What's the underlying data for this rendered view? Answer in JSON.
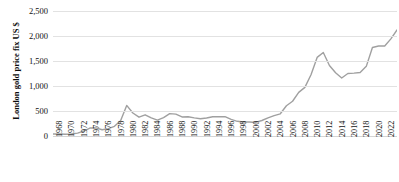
{
  "chart_data": {
    "type": "line",
    "title": "",
    "xlabel": "",
    "ylabel": "London gold price fix US $",
    "ylim": [
      0,
      2500
    ],
    "ytick_labels": [
      "2,500",
      "2,000",
      "1,500",
      "1,000",
      "500",
      "0"
    ],
    "ytick_values": [
      2500,
      2000,
      1500,
      1000,
      500,
      0
    ],
    "grid": true,
    "legend": "none",
    "line_color": "#a0a0a0",
    "gridline_color": "#e2e2e2",
    "x_tick_labels": [
      "1968",
      "1970",
      "1972",
      "1974",
      "1976",
      "1978",
      "1980",
      "1982",
      "1984",
      "1986",
      "1988",
      "1990",
      "1992",
      "1994",
      "1996",
      "1998",
      "2000",
      "2002",
      "2004",
      "2006",
      "2008",
      "2010",
      "2012",
      "2014",
      "2016",
      "2018",
      "2020",
      "2022",
      "2024"
    ],
    "xlim": [
      1968,
      2024
    ],
    "x": [
      1968,
      1969,
      1970,
      1971,
      1972,
      1973,
      1974,
      1975,
      1976,
      1977,
      1978,
      1979,
      1980,
      1981,
      1982,
      1983,
      1984,
      1985,
      1986,
      1987,
      1988,
      1989,
      1990,
      1991,
      1992,
      1993,
      1994,
      1995,
      1996,
      1997,
      1998,
      1999,
      2000,
      2001,
      2002,
      2003,
      2004,
      2005,
      2006,
      2007,
      2008,
      2009,
      2010,
      2011,
      2012,
      2013,
      2014,
      2015,
      2016,
      2017,
      2018,
      2019,
      2020,
      2021,
      2022,
      2023,
      2024
    ],
    "values": [
      39,
      41,
      36,
      41,
      58,
      97,
      159,
      161,
      125,
      148,
      193,
      306,
      612,
      460,
      376,
      424,
      361,
      317,
      368,
      447,
      437,
      381,
      384,
      362,
      344,
      360,
      384,
      384,
      388,
      331,
      294,
      279,
      279,
      271,
      310,
      363,
      409,
      444,
      604,
      695,
      872,
      972,
      1225,
      1572,
      1669,
      1411,
      1266,
      1160,
      1251,
      1257,
      1269,
      1393,
      1770,
      1799,
      1800,
      1943,
      2120
    ],
    "notes": {
      "peak_1980": 612,
      "peak_2012": 1669,
      "final_2024": 2120
    }
  }
}
